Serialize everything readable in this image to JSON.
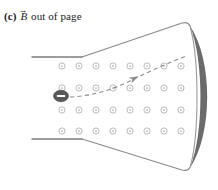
{
  "figure": {
    "part_label": "(c)",
    "field_symbol": "B",
    "vector_accent": "→",
    "caption_text": "out of page",
    "caption_full": "(c) B out of page"
  },
  "colors": {
    "background": "#ffffff",
    "outline": "#8a8a8a",
    "plate": "#7d7d7d",
    "screen_fill": "#6b6b6b",
    "screen_edge": "#9a9a9a",
    "field_symbol": "#a8a8a8",
    "particle_fill": "#575757",
    "particle_sign": "#ffffff",
    "trajectory": "#8c8c8c",
    "text": "#1b1b1b"
  },
  "particle": {
    "charge_sign": "−",
    "name": "electron",
    "cx": 61,
    "cy": 96,
    "rx": 7.5,
    "ry": 5.8
  },
  "magnetic_field": {
    "direction": "out-of-page",
    "symbol": "circled-dot",
    "rows": 4,
    "columns": 8,
    "row_y": [
      66,
      88,
      110,
      131
    ],
    "col_x": [
      62,
      79,
      96,
      113,
      130,
      147,
      164,
      181
    ],
    "dot_radius": 3.1,
    "center_radius": 0.85
  },
  "trajectory": {
    "style": "dashed",
    "has_arrowhead": true,
    "path": "M 70 97 C 92 96 112 90 132 80 C 150 71 168 63 186 56",
    "arrow_x": 135,
    "arrow_y": 78,
    "arrow_angle": -27
  },
  "geometry": {
    "top_plate": "M 32 57 L 82 57",
    "bottom_plate": "M 32 139 L 82 139",
    "top_funnel": "M 82 57 L 182 23 Q 190 21 191 30",
    "bottom_funnel": "M 82 139 L 182 170 Q 190 172 191 164",
    "screen_outline": "M 191 30 C 199 62 199 132 191 164",
    "screen_fill": "M 190 26 C 213 60 213 134 190 168 C 204 134 204 60 190 26 Z"
  },
  "screen": {
    "label": "phosphor-screen",
    "shape": "curved-crescent"
  }
}
